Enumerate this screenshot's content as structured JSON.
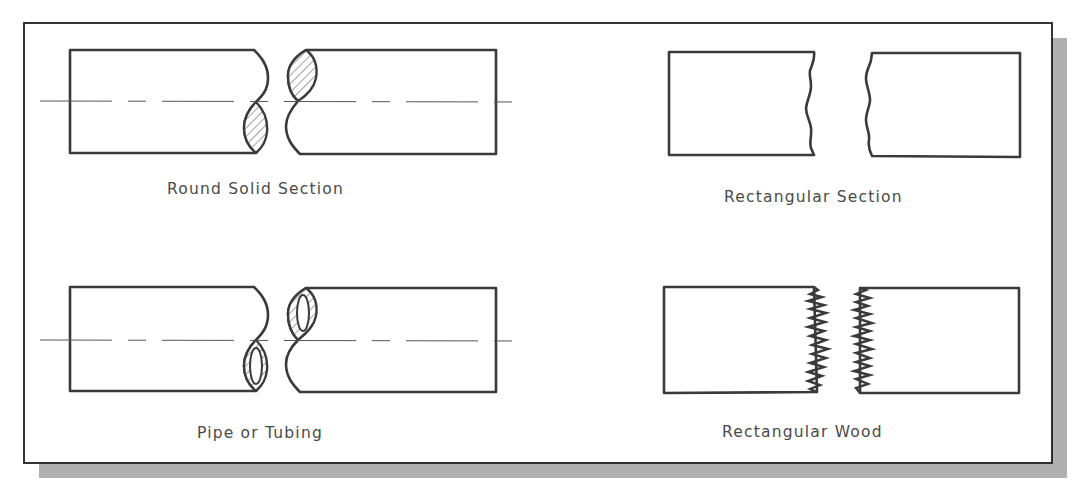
{
  "figure": {
    "frame": {
      "x": 24,
      "y": 23,
      "width": 1028,
      "height": 440,
      "shadow_offset": 15,
      "border_color": "#1e1e1e",
      "shadow_color": "#b0b0b0",
      "background": "#ffffff"
    },
    "panels": [
      {
        "id": "round-solid",
        "caption": "Round Solid Section",
        "break_style": "s-break-solid-hatched"
      },
      {
        "id": "rectangular",
        "caption": "Rectangular Section",
        "break_style": "freehand-wavy"
      },
      {
        "id": "pipe",
        "caption": "Pipe or Tubing",
        "break_style": "s-break-hollow-hatched"
      },
      {
        "id": "wood",
        "caption": "Rectangular Wood",
        "break_style": "zigzag-splintered"
      }
    ],
    "colors": {
      "line": "#3a3a3a",
      "text": "#4a4a4a",
      "centerline": "#555555"
    }
  }
}
